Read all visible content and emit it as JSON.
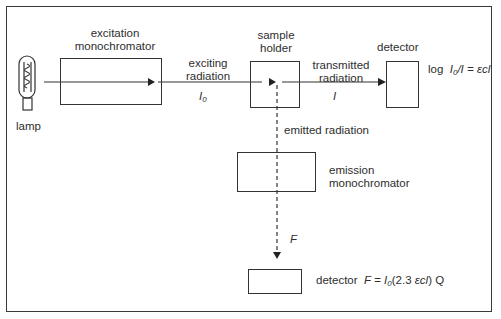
{
  "diagram": {
    "title": "",
    "components": {
      "lamp": {
        "label": "lamp"
      },
      "excitation_monochromator": {
        "label_line1": "excitation",
        "label_line2": "monochromator"
      },
      "sample_holder": {
        "label_line1": "sample",
        "label_line2": "holder"
      },
      "transmission_detector": {
        "label": "detector",
        "equation_prefix": "log",
        "equation_I0": "I",
        "equation_I0_sub": "0",
        "equation_rest": "/I = εcl"
      },
      "emission_monochromator": {
        "label_line1": "emission",
        "label_line2": "monochromator"
      },
      "fluorescence_detector": {
        "label": "detector",
        "equation_F": "F",
        "equation_eq": " = ",
        "equation_I0": "I",
        "equation_I0_sub": "0",
        "equation_paren": "(2.3 ",
        "equation_ecl": "εcl",
        "equation_end": ") Q"
      }
    },
    "beams": {
      "exciting": {
        "label_line1": "exciting",
        "label_line2": "radiation",
        "symbol": "I",
        "symbol_sub": "0"
      },
      "transmitted": {
        "label_line1": "transmitted",
        "label_line2": "radiation",
        "symbol": "I"
      },
      "emitted": {
        "label": "emitted  radiation",
        "symbol": "F"
      }
    },
    "colors": {
      "line": "#333333",
      "background": "#ffffff"
    }
  }
}
